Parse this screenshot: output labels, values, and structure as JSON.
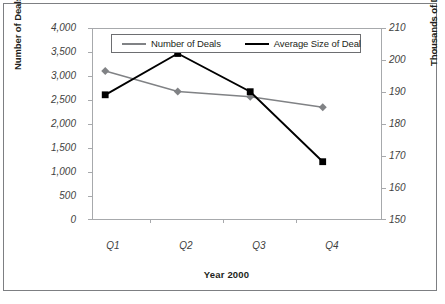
{
  "chart_data": {
    "type": "line",
    "title": "",
    "xlabel": "Year 2000",
    "ylabel": "Number of Deals/Year",
    "y2label": "Thousands of Dollars",
    "categories": [
      "Q1",
      "Q2",
      "Q3",
      "Q4"
    ],
    "series": [
      {
        "name": "Number of Deals",
        "axis": "left",
        "color": "#808285",
        "marker": "diamond",
        "values": [
          3100,
          2670,
          2560,
          2340
        ]
      },
      {
        "name": "Average Size of Deal",
        "axis": "right",
        "color": "#000000",
        "marker": "square",
        "values": [
          189,
          202,
          190,
          168
        ]
      }
    ],
    "ylim": [
      0,
      4000
    ],
    "y2lim": [
      150,
      210
    ],
    "yticks": [
      "0",
      "500",
      "1,000",
      "1,500",
      "2,000",
      "2,500",
      "3,000",
      "3,500",
      "4,000"
    ],
    "ytick_values": [
      0,
      500,
      1000,
      1500,
      2000,
      2500,
      3000,
      3500,
      4000
    ],
    "y2ticks": [
      "150",
      "160",
      "170",
      "180",
      "190",
      "200",
      "210"
    ],
    "y2tick_values": [
      150,
      160,
      170,
      180,
      190,
      200,
      210
    ],
    "grid": false,
    "legend_position": "top-center",
    "legend_entries": [
      "Number of Deals",
      "Average Size of Deal"
    ]
  },
  "axes": {
    "left_title": "Number of Deals/Year",
    "right_title": "Thousands of Dollars",
    "x_title": "Year 2000"
  },
  "legend": {
    "items": [
      {
        "label": "Number of Deals"
      },
      {
        "label": "Average Size of Deal"
      }
    ]
  },
  "colors": {
    "series_gray": "#808285",
    "series_black": "#000000",
    "axis": "#a7a9ac",
    "frame": "#7d7f82",
    "text": "#231f20"
  }
}
